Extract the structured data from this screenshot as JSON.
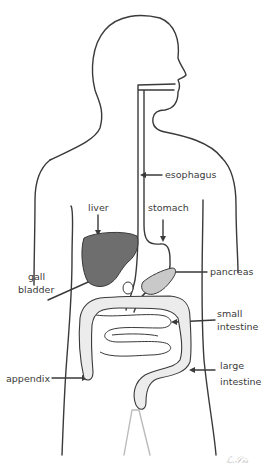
{
  "diagram": {
    "colors": {
      "outline": "#3a3a3a",
      "liver_fill": "#6e6e6e",
      "pancreas_fill": "#c9c9c9",
      "intestine_shade": "#dcdcdc",
      "background": "#ffffff"
    },
    "labels": {
      "esophagus": "esophagus",
      "liver": "liver",
      "stomach": "stomach",
      "gall_bladder_line1": "gall",
      "gall_bladder_line2": "bladder",
      "pancreas": "pancreas",
      "small_intestine_line1": "small",
      "small_intestine_line2": "intestine",
      "large_intestine_line1": "large",
      "large_intestine_line2": "intestine",
      "appendix": "appendix"
    },
    "signature": "ℒ.𝒮𝒾𝓈"
  }
}
